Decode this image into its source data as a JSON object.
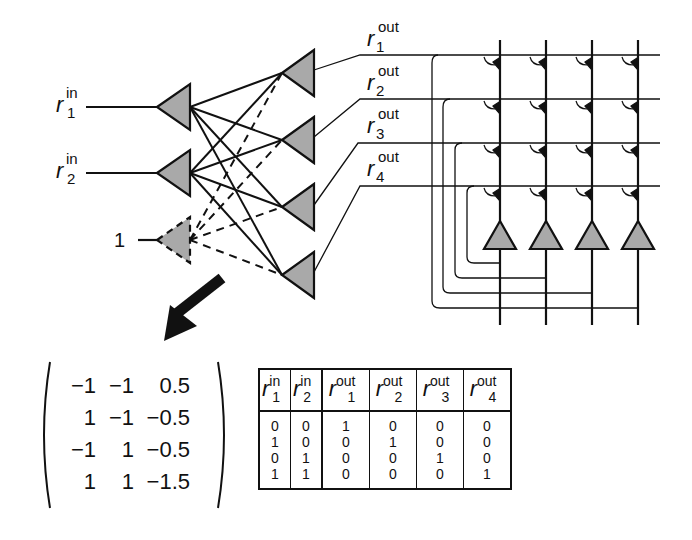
{
  "inputs": [
    {
      "var": "r",
      "sup": "in",
      "sub": "1"
    },
    {
      "var": "r",
      "sup": "in",
      "sub": "2"
    }
  ],
  "bias": {
    "label": "1"
  },
  "outputs": [
    {
      "var": "r",
      "sup": "out",
      "sub": "1"
    },
    {
      "var": "r",
      "sup": "out",
      "sub": "2"
    },
    {
      "var": "r",
      "sup": "out",
      "sub": "3"
    },
    {
      "var": "r",
      "sup": "out",
      "sub": "4"
    }
  ],
  "weight_matrix": {
    "rows": [
      [
        "−1",
        "−1",
        "0.5"
      ],
      [
        "1",
        "−1",
        "−0.5"
      ],
      [
        "−1",
        "1",
        "−0.5"
      ],
      [
        "1",
        "1",
        "−1.5"
      ]
    ]
  },
  "truth_table": {
    "headers": [
      {
        "var": "r",
        "sup": "in",
        "sub": "1"
      },
      {
        "var": "r",
        "sup": "in",
        "sub": "2"
      },
      {
        "var": "r",
        "sup": "out",
        "sub": "1"
      },
      {
        "var": "r",
        "sup": "out",
        "sub": "2"
      },
      {
        "var": "r",
        "sup": "out",
        "sub": "3"
      },
      {
        "var": "r",
        "sup": "out",
        "sub": "4"
      }
    ],
    "rows": [
      [
        "0",
        "0",
        "1",
        "0",
        "0",
        "0"
      ],
      [
        "1",
        "0",
        "0",
        "1",
        "0",
        "0"
      ],
      [
        "0",
        "1",
        "0",
        "0",
        "1",
        "0"
      ],
      [
        "1",
        "1",
        "0",
        "0",
        "0",
        "1"
      ]
    ]
  },
  "colors": {
    "neuron_fill": "#a9a9a9",
    "stroke": "#111111",
    "background": "#ffffff"
  }
}
